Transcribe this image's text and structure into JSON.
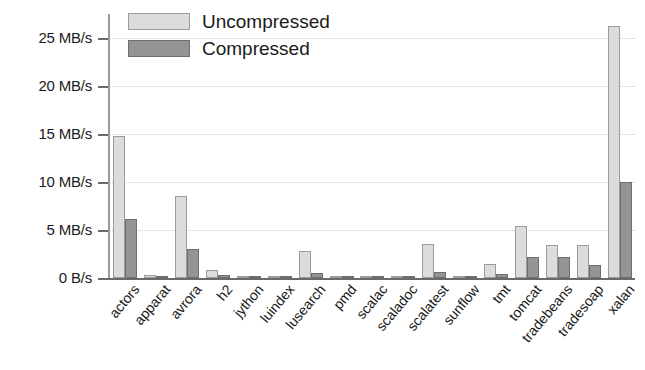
{
  "chart_data": {
    "type": "bar",
    "title": "",
    "xlabel": "",
    "ylabel": "",
    "ylim": [
      0,
      27.5
    ],
    "grid": true,
    "legend_position": "top-left",
    "categories": [
      "actors",
      "apparat",
      "avrora",
      "h2",
      "jython",
      "luindex",
      "lusearch",
      "pmd",
      "scalac",
      "scaladoc",
      "scalatest",
      "sunflow",
      "tmt",
      "tomcat",
      "tradebeans",
      "tradesoap",
      "xalan"
    ],
    "ytick_labels": [
      "25 MB/s",
      "20 MB/s",
      "15 MB/s",
      "10 MB/s",
      "5 MB/s",
      "0 B/s"
    ],
    "ytick_values": [
      25,
      20,
      15,
      10,
      5,
      0
    ],
    "unit": "MB/s",
    "series": [
      {
        "name": "Uncompressed",
        "color": "#dcdcdc",
        "values": [
          14.8,
          0.3,
          8.5,
          0.8,
          0.05,
          0.1,
          2.8,
          0.15,
          0.05,
          0.1,
          3.5,
          0.1,
          1.5,
          5.4,
          3.4,
          3.4,
          26.2
        ]
      },
      {
        "name": "Compressed",
        "color": "#949494",
        "values": [
          6.1,
          0.1,
          3.0,
          0.3,
          0.02,
          0.05,
          0.5,
          0.05,
          0.02,
          0.05,
          0.6,
          0.05,
          0.4,
          2.2,
          2.2,
          1.4,
          10.0
        ]
      }
    ]
  },
  "legend": {
    "items": [
      {
        "label": "Uncompressed",
        "color": "#dcdcdc"
      },
      {
        "label": "Compressed",
        "color": "#949494"
      }
    ]
  }
}
